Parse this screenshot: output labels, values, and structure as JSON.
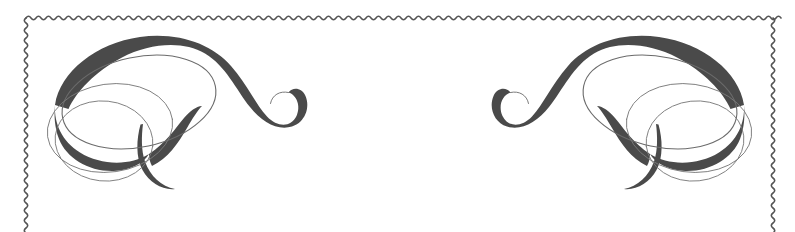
{
  "canvas": {
    "width": 795,
    "height": 232,
    "background_color": "#ffffff",
    "title": "Ornamental Border Frame"
  },
  "palette": {
    "background": "#ffffff",
    "frame_stroke": "#555555",
    "swash_dark": "#4a4a4a",
    "hairline": "#6b6b6b",
    "hairline_light": "#7a7a7a"
  },
  "frame": {
    "name": "scalloped-wavy-border",
    "style": "wavy",
    "left_x": 26,
    "right_x": 773,
    "top_y": 18,
    "bottom_open": true,
    "wave_period": 10,
    "wave_amplitude": 2.6,
    "stroke_width": 1.6,
    "stroke_color": "#555555"
  },
  "ornaments": [
    {
      "name": "flourish-top-left",
      "type": "calligraphic-swash",
      "corner": "top-left",
      "mirrored": false,
      "fill_color": "#4a4a4a",
      "loop_count": 3,
      "description": "S-curve swash with thick-to-thin modulation, upper spiral hook terminal and lower tapered tail, overlaid by three thin elliptical loops"
    },
    {
      "name": "flourish-top-right",
      "type": "calligraphic-swash",
      "corner": "top-right",
      "mirrored": true,
      "fill_color": "#4a4a4a",
      "loop_count": 3,
      "description": "Horizontal mirror of the top-left flourish"
    }
  ]
}
